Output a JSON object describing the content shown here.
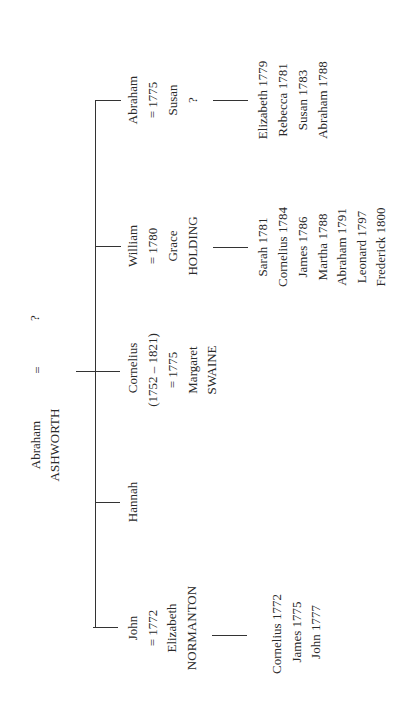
{
  "root": {
    "name": "Abraham",
    "surname": "ASHWORTH",
    "marriage_symbol": "=",
    "spouse": "?"
  },
  "children": [
    {
      "name": "Abraham",
      "lines": [
        "Abraham",
        "= 1775",
        "Susan",
        "?"
      ],
      "offspring": [
        "Elizabeth 1779",
        "Rebecca 1781",
        "Susan 1783",
        "Abraham 1788"
      ]
    },
    {
      "name": "William",
      "lines": [
        "William",
        "= 1780",
        "Grace",
        "HOLDING"
      ],
      "offspring": [
        "Sarah 1781",
        "Cornelius 1784",
        "James 1786",
        "Martha 1788",
        "Abraham 1791",
        "Leonard 1797",
        "Frederick 1800"
      ]
    },
    {
      "name": "Cornelius",
      "lines": [
        "Cornelius",
        "(1752 – 1821)",
        "= 1775",
        "Margaret",
        "SWAINE"
      ],
      "offspring": []
    },
    {
      "name": "Hannah",
      "lines": [
        "Hannah"
      ],
      "offspring": []
    },
    {
      "name": "John",
      "lines": [
        "John",
        "= 1772",
        "Elizabeth",
        "NORMANTON"
      ],
      "offspring": [
        "Cornelius 1772",
        "James 1775",
        "John 1777"
      ]
    }
  ]
}
